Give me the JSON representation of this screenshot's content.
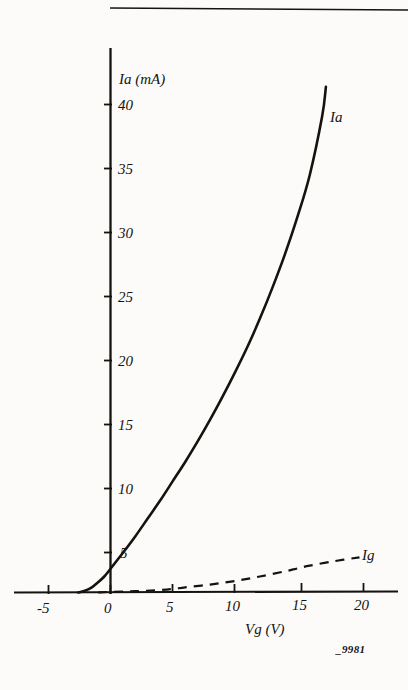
{
  "figure": {
    "reference": "_9981",
    "top_rule": true,
    "background_color": "#fcfbfa",
    "ink_color": "#16130f"
  },
  "chart_data": {
    "type": "line",
    "title": "",
    "subtitle": "",
    "xlabel": "Vg (V)",
    "ylabel": "Ia (mA)",
    "xlim": [
      -6.0,
      22.5
    ],
    "ylim": [
      0,
      42
    ],
    "grid": false,
    "legend_position": "inline-end-of-curve",
    "xticks": [
      -5,
      0,
      5,
      10,
      15,
      20
    ],
    "xtick_labels": [
      "-5",
      "0",
      "5",
      "10",
      "15",
      "20"
    ],
    "yticks": [
      5,
      10,
      15,
      20,
      25,
      30,
      35,
      40
    ],
    "ytick_labels": [
      "5",
      "10",
      "15",
      "20",
      "25",
      "30",
      "35",
      "40"
    ],
    "annotations": [
      {
        "text": "Ia (mA)",
        "x": 0.6,
        "y": 41.0,
        "role": "y-axis-title"
      },
      {
        "text": "Vg (V)",
        "x": 11.5,
        "y": -4.5,
        "role": "x-axis-title"
      },
      {
        "text": "Ia",
        "x": 17.9,
        "y": 38.8,
        "role": "series-label"
      },
      {
        "text": "Ig",
        "x": 20.8,
        "y": 3.6,
        "role": "series-label"
      },
      {
        "text": "_9981",
        "x": 19.0,
        "y": -8.0,
        "role": "figure-reference"
      }
    ],
    "series": [
      {
        "name": "Ia",
        "label": "Ia",
        "style": "solid",
        "units": "mA",
        "x": [
          -2.6,
          -2.0,
          -1.5,
          -1.0,
          -0.5,
          0.0,
          1.0,
          2.0,
          3.0,
          4.0,
          5.0,
          6.0,
          7.0,
          8.0,
          9.0,
          10.0,
          11.0,
          12.0,
          13.0,
          14.0,
          15.0,
          16.0,
          17.0,
          17.3
        ],
        "values": [
          0.0,
          0.15,
          0.4,
          0.8,
          1.25,
          1.85,
          3.1,
          4.4,
          5.8,
          7.2,
          8.7,
          10.2,
          11.8,
          13.5,
          15.3,
          17.2,
          19.2,
          21.4,
          23.8,
          26.4,
          29.3,
          32.6,
          37.2,
          39.5
        ]
      },
      {
        "name": "Ig",
        "label": "Ig",
        "style": "dashed",
        "units": "mA",
        "x": [
          -1.0,
          0.0,
          2.0,
          4.0,
          5.0,
          6.0,
          8.0,
          10.0,
          12.0,
          14.0,
          15.0,
          16.0,
          18.0,
          20.0
        ],
        "values": [
          0.0,
          0.05,
          0.1,
          0.2,
          0.28,
          0.4,
          0.62,
          0.9,
          1.25,
          1.65,
          1.88,
          2.1,
          2.45,
          2.75
        ]
      }
    ]
  }
}
